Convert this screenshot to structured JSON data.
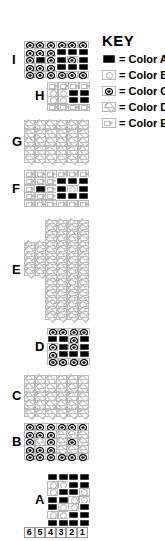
{
  "key": {
    "title": "KEY",
    "items": [
      {
        "symbol": "A",
        "icon": "filled-black-square-icon",
        "label": "= Color A"
      },
      {
        "symbol": "B",
        "icon": "open-circle-icon",
        "label": "= Color B"
      },
      {
        "symbol": "C",
        "icon": "bullseye-oval-icon",
        "label": "= Color C"
      },
      {
        "symbol": "D",
        "icon": "diamond-line-icon",
        "label": "= Color D"
      },
      {
        "symbol": "E",
        "icon": "right-arrow-icon",
        "label": "= Color E"
      }
    ]
  },
  "sections": [
    {
      "label": "I",
      "left": 24,
      "top": 41,
      "cols": 6,
      "cellW": 10.7,
      "cellH": 7.4,
      "rows": [
        "CCCCCC",
        "CCCAAA",
        "CACACA",
        "CCCAAA",
        "CCCCCC"
      ]
    },
    {
      "label": "H",
      "left": 47,
      "top": 82,
      "cols": 4,
      "cellW": 10.5,
      "cellH": 7.2,
      "rows": [
        "EEEE",
        "BBAA",
        "BBAA",
        "EEEE"
      ]
    },
    {
      "label": "G",
      "left": 24,
      "top": 120,
      "cols": 6,
      "cellW": 10.7,
      "cellH": 8.6,
      "rows": [
        "DDDDDD",
        "DDDDDD",
        "DDDDDD",
        "DDDDDD",
        "DDDDDD"
      ]
    },
    {
      "label": "F",
      "left": 24,
      "top": 170,
      "cols": 6,
      "cellW": 10.7,
      "cellH": 7.4,
      "rows": [
        "EEEEEE",
        "EEEAAA",
        "EAEABA",
        "EEEAAA",
        "EEEEEE"
      ]
    },
    {
      "label": "E",
      "left": 24,
      "top": 220,
      "cols": 6,
      "cellW": 10.7,
      "cellH": 5.5,
      "rows": [
        "..DDDD",
        "..DDDD",
        "..DDDD",
        "..DDDD",
        "DDDDDD",
        "DDDDDD",
        "DDDDDD",
        "DDDDDD",
        "DDDDDD",
        "DDDDDD",
        "..DDDD",
        "..DDDD",
        "..DDDD",
        "..DDDD",
        "..DDDD",
        "..DDDD",
        "..DDDD",
        "..DDDD"
      ]
    },
    {
      "label": "D",
      "left": 47,
      "top": 328,
      "cols": 4,
      "cellW": 10.5,
      "cellH": 7.4,
      "rows": [
        "CCCC",
        "AACA",
        "CACA",
        "CAAA",
        "CCCC"
      ]
    },
    {
      "label": "C",
      "left": 24,
      "top": 375,
      "cols": 6,
      "cellW": 10.7,
      "cellH": 8.4,
      "rows": [
        "DDDDDD",
        "DDDDDD",
        "DDDDDD",
        "DDDDDD",
        "DDDDDD"
      ]
    },
    {
      "label": "B",
      "left": 24,
      "top": 423,
      "cols": 6,
      "cellW": 10.7,
      "cellH": 7.4,
      "rows": [
        "CCCCCC",
        "CCCDDD",
        "CDCDCD",
        "CCCDDD",
        "CCCCCC"
      ]
    },
    {
      "label": "A",
      "left": 47,
      "top": 473,
      "cols": 4,
      "cellW": 10.5,
      "cellH": 7.6,
      "rows": [
        "AAAA",
        "BBAA",
        "BAAB",
        "AABB",
        "ABBA",
        "BBAA",
        "AAAA"
      ]
    }
  ],
  "stitch_numbers": [
    "6",
    "5",
    "4",
    "3",
    "2",
    "1"
  ]
}
